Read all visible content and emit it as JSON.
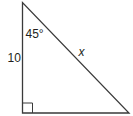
{
  "figure": {
    "type": "right-triangle",
    "stroke_color": "#3a3a3a",
    "labels": {
      "angle": "45°",
      "vertical_side": "10",
      "hypotenuse": "x"
    },
    "right_angle_marker": true
  }
}
